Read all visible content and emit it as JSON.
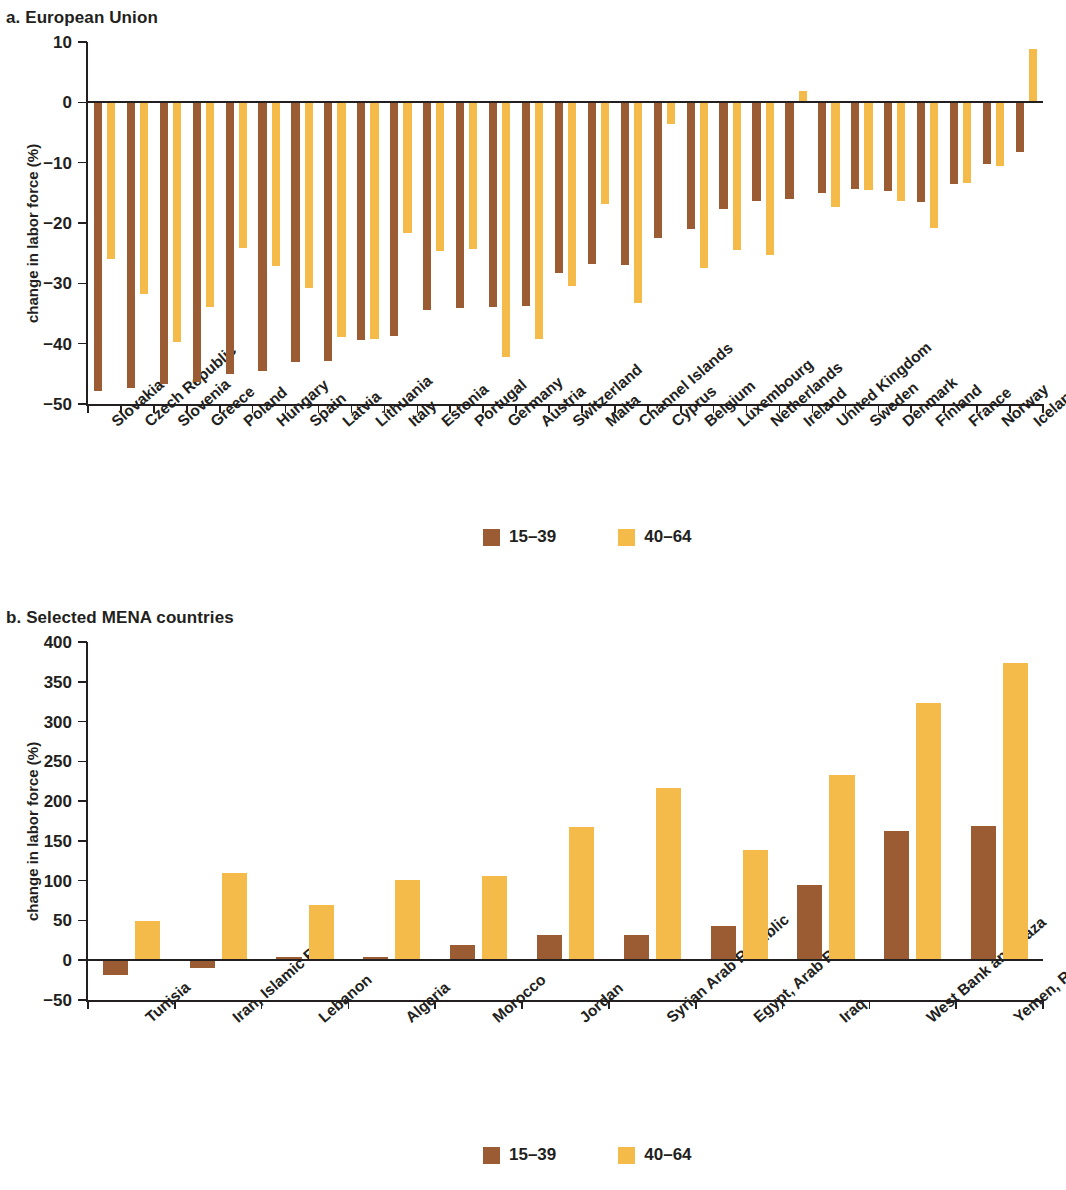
{
  "panel_a": {
    "title": "a. European Union",
    "ylabel": "change in labor force (%)",
    "yticks": [
      "10",
      "0",
      "−10",
      "−20",
      "−30",
      "−40",
      "−50"
    ]
  },
  "panel_b": {
    "title": "b. Selected MENA countries",
    "ylabel": "change in labor force (%)",
    "yticks": [
      "400",
      "350",
      "300",
      "250",
      "200",
      "150",
      "100",
      "50",
      "0",
      "−50"
    ]
  },
  "legend": {
    "series1_label": "15–39",
    "series2_label": "40–64",
    "series1_color": "#9b5b33",
    "series2_color": "#f5bb4a"
  },
  "chart_data": [
    {
      "type": "bar",
      "title": "a. European Union",
      "xlabel": "",
      "ylabel": "change in labor force (%)",
      "ylim": [
        -50,
        10
      ],
      "ytick_values": [
        10,
        0,
        -10,
        -20,
        -30,
        -40,
        -50
      ],
      "grid": false,
      "legend_position": "bottom-center",
      "categories": [
        "Slovakia",
        "Czech Republic",
        "Slovenia",
        "Greece",
        "Poland",
        "Hungary",
        "Spain",
        "Latvia",
        "Lithuania",
        "Italy",
        "Estonia",
        "Portugal",
        "Germany",
        "Austria",
        "Switzerland",
        "Malta",
        "Channel Islands",
        "Cyprus",
        "Belgium",
        "Luxembourg",
        "Netherlands",
        "Ireland",
        "United Kingdom",
        "Sweden",
        "Denmark",
        "Finland",
        "France",
        "Norway",
        "Iceland"
      ],
      "series": [
        {
          "name": "15–39",
          "color": "#9b5b33",
          "values": [
            -47.8,
            -47.3,
            -46.7,
            -46.4,
            -45.0,
            -44.6,
            -43.0,
            -42.9,
            -39.4,
            -38.7,
            -34.5,
            -34.1,
            -34.0,
            -33.7,
            -28.3,
            -26.8,
            -26.9,
            -22.5,
            -21.0,
            -17.6,
            -16.4,
            -16.1,
            -15.0,
            -14.4,
            -14.7,
            -16.5,
            -13.6,
            -10.2,
            -8.2
          ]
        },
        {
          "name": "40–64",
          "color": "#f5bb4a",
          "values": [
            -26.0,
            -31.8,
            -39.8,
            -33.9,
            -24.2,
            -27.2,
            -30.8,
            -38.9,
            -39.2,
            -21.6,
            -24.7,
            -24.3,
            -42.2,
            -39.3,
            -30.5,
            -16.9,
            -33.3,
            -3.6,
            -27.4,
            -24.4,
            -25.3,
            1.9,
            -17.3,
            -14.5,
            -16.3,
            -20.9,
            -13.3,
            -10.6,
            8.9
          ]
        }
      ]
    },
    {
      "type": "bar",
      "title": "b. Selected MENA countries",
      "xlabel": "",
      "ylabel": "change in labor force (%)",
      "ylim": [
        -50,
        400
      ],
      "ytick_values": [
        400,
        350,
        300,
        250,
        200,
        150,
        100,
        50,
        0,
        -50
      ],
      "grid": false,
      "legend_position": "bottom-center",
      "categories": [
        "Tunisia",
        "Iran, Islamic Rep.",
        "Lebanon",
        "Algeria",
        "Morocco",
        "Jordan",
        "Syrian Arab Republic",
        "Egypt, Arab Rep.",
        "Iraq",
        "West Bank and Gaza",
        "Yemen, Rep."
      ],
      "series": [
        {
          "name": "15–39",
          "color": "#9b5b33",
          "values": [
            -19,
            -10,
            4,
            4,
            19,
            32,
            32,
            43,
            94,
            163,
            169
          ]
        },
        {
          "name": "40–64",
          "color": "#f5bb4a",
          "values": [
            49,
            110,
            70,
            101,
            106,
            167,
            217,
            138,
            233,
            323,
            374
          ]
        }
      ]
    }
  ]
}
